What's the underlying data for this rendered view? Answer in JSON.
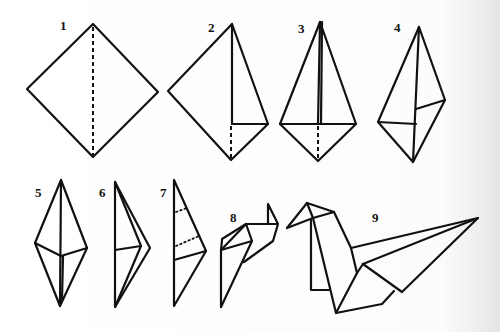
{
  "diagram": {
    "steps": [
      {
        "label": "1",
        "description": "Square diamond with vertical dashed fold line"
      },
      {
        "label": "2",
        "description": "Right half folded to center"
      },
      {
        "label": "3",
        "description": "Both sides folded to center"
      },
      {
        "label": "4",
        "description": "Kite shape folded"
      },
      {
        "label": "5",
        "description": "Elongated diamond"
      },
      {
        "label": "6",
        "description": "Narrow fold"
      },
      {
        "label": "7",
        "description": "Narrow shape with dotted fold lines"
      },
      {
        "label": "8",
        "description": "Head and neck formed"
      },
      {
        "label": "9",
        "description": "Finished crane"
      }
    ],
    "colors": {
      "line": "#111111",
      "background": "#ffffff"
    }
  }
}
